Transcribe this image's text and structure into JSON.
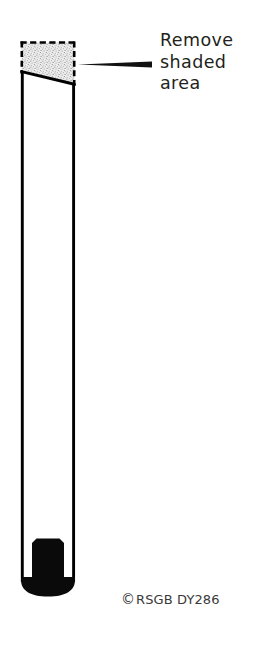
{
  "diagram": {
    "callout": {
      "lines": [
        "Remove",
        "shaded",
        "area"
      ],
      "pointer": "tapered-leader-line"
    },
    "credit": {
      "copyright_symbol": "©",
      "text": "RSGB DY286"
    },
    "colors": {
      "ink": "#000000",
      "text": "#231f20",
      "credit_text": "#3a3a3a",
      "shading_fill": "#d9d9d9",
      "background": "#ffffff"
    },
    "parts": {
      "tube_body": "vertical-tapered-tube",
      "dashed_region": "removal-boundary",
      "shaded_region": "stippled-waste-area",
      "cut_line": "angled-cut-line",
      "plug": "black-chamfered-plug",
      "tube_base": "rounded-black-base"
    }
  }
}
